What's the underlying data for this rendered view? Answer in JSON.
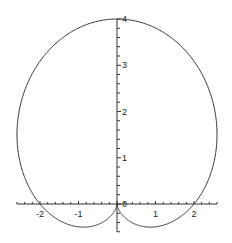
{
  "chart_data": {
    "type": "line",
    "subtype": "polar-curve",
    "title": "",
    "equation_hint": "cardioid r = 2(1 + sin θ)",
    "xlabel": "",
    "ylabel": "",
    "xlim": [
      -2.6,
      2.6
    ],
    "ylim": [
      -0.6,
      4.0
    ],
    "grid": false,
    "legend": null,
    "x_ticks": [
      -2,
      -1,
      0,
      1,
      2
    ],
    "x_tick_labels": [
      "-2",
      "-1",
      "0",
      "1",
      "2"
    ],
    "y_ticks": [
      0,
      1,
      2,
      3,
      4
    ],
    "y_tick_labels": [
      "0",
      "1",
      "2",
      "3",
      "4"
    ],
    "key_points": [
      {
        "x": 0,
        "y": 4
      },
      {
        "x": 2,
        "y": 0
      },
      {
        "x": -2,
        "y": 0
      },
      {
        "x": 0,
        "y": 0
      },
      {
        "x": 0.866,
        "y": -0.5
      },
      {
        "x": -0.866,
        "y": -0.5
      }
    ],
    "series": [
      {
        "name": "curve",
        "color": "#333333",
        "param": "theta",
        "r_a": 2,
        "r_b": 2
      }
    ]
  },
  "axes": {
    "color": "#333333",
    "origin_px": {
      "x": 117,
      "y": 204
    },
    "x_scale_px": 38.5,
    "y_scale_px": 46.25
  }
}
